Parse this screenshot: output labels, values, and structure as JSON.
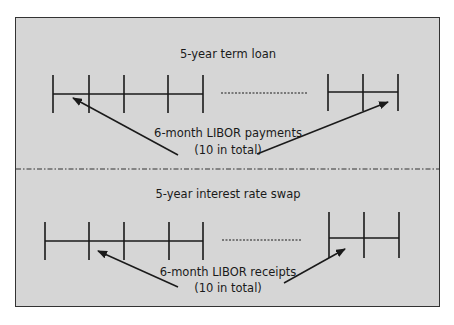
{
  "colors": {
    "background": "#d6d6d6",
    "line": "#1a1a1a",
    "border": "#333333"
  },
  "top_panel": {
    "title": "5-year term loan",
    "annotation_line1": "6-month LIBOR payments",
    "annotation_line2": "(10 in total)",
    "timeline_left_ticks": 5,
    "timeline_right_ticks": 3
  },
  "bottom_panel": {
    "title": "5-year interest rate swap",
    "annotation_line1": "6-month LIBOR receipts",
    "annotation_line2": "(10 in total)",
    "timeline_left_ticks": 5,
    "timeline_right_ticks": 3
  }
}
